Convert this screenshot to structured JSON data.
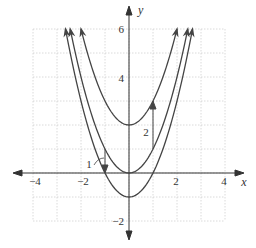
{
  "chart_data": {
    "type": "line",
    "title": "",
    "xlabel": "x",
    "ylabel": "y",
    "xlim": [
      -4,
      4
    ],
    "ylim": [
      -2,
      6
    ],
    "grid": true,
    "x_ticks": [
      -4,
      -2,
      2,
      4
    ],
    "y_ticks": [
      -2,
      4,
      6
    ],
    "x_tick_labels": [
      "−4",
      "−2",
      "2",
      "4"
    ],
    "y_tick_labels": [
      "−2",
      "4",
      "6"
    ],
    "series": [
      {
        "name": "y = x^2 + 2",
        "vertex": [
          0,
          2
        ],
        "x_range": [
          -2,
          2
        ],
        "points": [
          [
            -2,
            6
          ],
          [
            -1,
            3
          ],
          [
            0,
            2
          ],
          [
            1,
            3
          ],
          [
            2,
            6
          ]
        ]
      },
      {
        "name": "y = x^2",
        "vertex": [
          0,
          0
        ],
        "x_range": [
          -2.449,
          2.449
        ],
        "points": [
          [
            -2.449,
            6
          ],
          [
            -2,
            4
          ],
          [
            -1,
            1
          ],
          [
            0,
            0
          ],
          [
            1,
            1
          ],
          [
            2,
            4
          ],
          [
            2.449,
            6
          ]
        ]
      },
      {
        "name": "y = x^2 - 1",
        "vertex": [
          0,
          -1
        ],
        "x_range": [
          -2.646,
          2.646
        ],
        "points": [
          [
            -2.646,
            6
          ],
          [
            -2,
            3
          ],
          [
            -1,
            0
          ],
          [
            0,
            -1
          ],
          [
            1,
            0
          ],
          [
            2,
            3
          ],
          [
            2.646,
            6
          ]
        ]
      }
    ],
    "annotations": [
      {
        "label": "2",
        "type": "vertical-arrow",
        "x": 1,
        "from_y": 1,
        "to_y": 3,
        "meaning": "shift up 2"
      },
      {
        "label": "1",
        "type": "vertical-arrow",
        "x": -1,
        "from_y": 1,
        "to_y": 0,
        "meaning": "shift down 1"
      }
    ]
  },
  "labels": {
    "x_axis": "x",
    "y_axis": "y",
    "annotation_up": "2",
    "annotation_down": "1"
  },
  "colors": {
    "curve": "#444444",
    "axis": "#333333",
    "grid": "#d0d0d0"
  }
}
